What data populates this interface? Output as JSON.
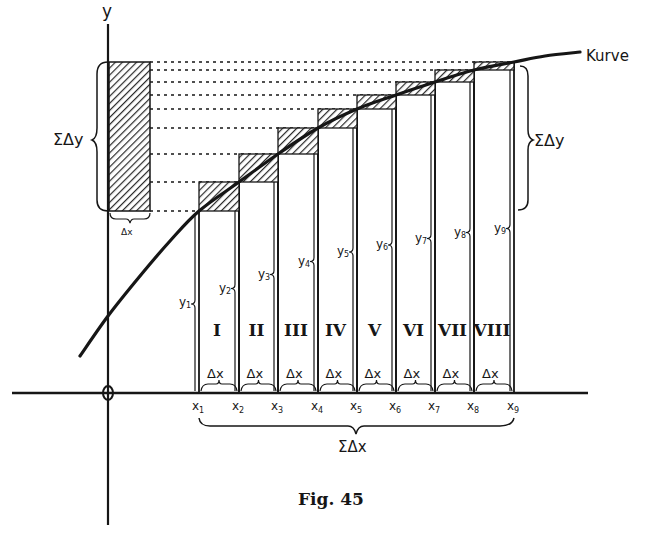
{
  "figure": {
    "caption": "Fig. 45",
    "y_axis_label": "y",
    "origin_label": "0",
    "curve_label": "Kurve",
    "sum_dy_label": "ΣΔy",
    "sum_dx_label": "ΣΔx",
    "dx_label": "Δx",
    "x_labels": [
      "x",
      "x",
      "x",
      "x",
      "x",
      "x",
      "x",
      "x",
      "x"
    ],
    "x_subscripts": [
      "1",
      "2",
      "3",
      "4",
      "5",
      "6",
      "7",
      "8",
      "9"
    ],
    "y_labels": [
      "y",
      "y",
      "y",
      "y",
      "y",
      "y",
      "y",
      "y",
      "y"
    ],
    "y_subscripts": [
      "1",
      "2",
      "3",
      "4",
      "5",
      "6",
      "7",
      "8",
      "9"
    ],
    "strip_numerals": [
      "I",
      "II",
      "III",
      "IV",
      "V",
      "VI",
      "VII",
      "VIII"
    ],
    "colors": {
      "ink": "#161616",
      "paper": "#ffffff",
      "hatch": "#2a2a2a"
    }
  }
}
